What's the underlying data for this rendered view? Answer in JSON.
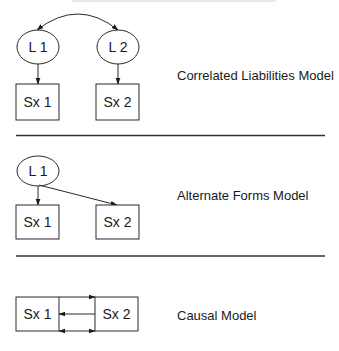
{
  "diagram": {
    "panels": [
      {
        "id": "correlated-liabilities",
        "label": "Correlated Liabilities Model",
        "latents": [
          {
            "id": "L1",
            "text": "L 1"
          },
          {
            "id": "L2",
            "text": "L 2"
          }
        ],
        "observed": [
          {
            "id": "Sx1",
            "text": "Sx 1"
          },
          {
            "id": "Sx2",
            "text": "Sx 2"
          }
        ],
        "edges": [
          {
            "from": "L1",
            "to": "L2",
            "type": "double-headed-curved"
          },
          {
            "from": "L1",
            "to": "Sx1",
            "type": "directed"
          },
          {
            "from": "L2",
            "to": "Sx2",
            "type": "directed"
          }
        ]
      },
      {
        "id": "alternate-forms",
        "label": "Alternate Forms Model",
        "latents": [
          {
            "id": "L1",
            "text": "L 1"
          }
        ],
        "observed": [
          {
            "id": "Sx1",
            "text": "Sx 1"
          },
          {
            "id": "Sx2",
            "text": "Sx 2"
          }
        ],
        "edges": [
          {
            "from": "L1",
            "to": "Sx1",
            "type": "directed"
          },
          {
            "from": "L1",
            "to": "Sx2",
            "type": "directed"
          }
        ]
      },
      {
        "id": "causal",
        "label": "Causal Model",
        "latents": [],
        "observed": [
          {
            "id": "Sx1",
            "text": "Sx 1"
          },
          {
            "id": "Sx2",
            "text": "Sx 2"
          }
        ],
        "edges": [
          {
            "from": "Sx1",
            "to": "Sx2",
            "type": "directed"
          },
          {
            "from": "Sx2",
            "to": "Sx1",
            "type": "directed"
          },
          {
            "from": "Sx1",
            "to": "Sx2",
            "type": "double-headed"
          }
        ]
      }
    ]
  },
  "colors": {
    "stroke": "#2a2a2a",
    "text": "#1a1a1a",
    "background": "#ffffff"
  }
}
